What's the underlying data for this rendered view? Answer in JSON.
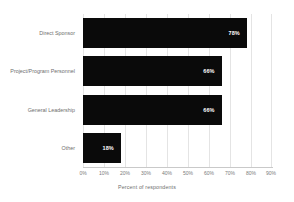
{
  "chart_data": {
    "type": "bar",
    "orientation": "horizontal",
    "title": "",
    "xlabel": "Percent of respondents",
    "ylabel": "",
    "categories": [
      "Direct Sponsor",
      "Project/Program Personnel",
      "General Leadership",
      "Other"
    ],
    "values": [
      78,
      66,
      66,
      18
    ],
    "value_labels": [
      "78%",
      "66%",
      "66%",
      "18%"
    ],
    "xlim": [
      0,
      90
    ],
    "xticks": [
      0,
      10,
      20,
      30,
      40,
      50,
      60,
      70,
      80,
      90
    ],
    "xtick_labels": [
      "0%",
      "10%",
      "20%",
      "30%",
      "40%",
      "50%",
      "60%",
      "70%",
      "80%",
      "90%"
    ],
    "grid": "vertical",
    "legend": "none",
    "bar_color": "#0a0a0a",
    "value_label_color": "#ffffff",
    "gridline_color": "#e4e4e4",
    "axis_text_color": "#6e6e6e",
    "background_color": "#ffffff"
  }
}
